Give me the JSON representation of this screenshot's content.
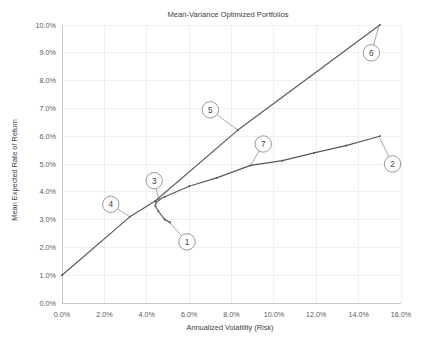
{
  "chart_data": {
    "type": "line",
    "title": "Mean-Variance Optimized Portfolios",
    "xlabel": "Annualized Volatility (Risk)",
    "ylabel": "Mean Expected Rate of Return",
    "xlim": [
      0.0,
      16.0
    ],
    "ylim": [
      0.0,
      10.0
    ],
    "xticks": [
      "0.0%",
      "2.0%",
      "4.0%",
      "6.0%",
      "8.0%",
      "10.0%",
      "12.0%",
      "14.0%",
      "16.0%"
    ],
    "yticks": [
      "0.0%",
      "1.0%",
      "2.0%",
      "3.0%",
      "4.0%",
      "5.0%",
      "6.0%",
      "7.0%",
      "8.0%",
      "9.0%",
      "10.0%"
    ],
    "xtick_values": [
      0,
      2,
      4,
      6,
      8,
      10,
      12,
      14,
      16
    ],
    "ytick_values": [
      0,
      1,
      2,
      3,
      4,
      5,
      6,
      7,
      8,
      9,
      10
    ],
    "grid": true,
    "legend": "none",
    "series": [
      {
        "name": "Capital Allocation Line",
        "x": [
          0.0,
          3.2,
          4.4,
          8.3,
          15.0
        ],
        "y": [
          1.0,
          3.1,
          3.67,
          6.22,
          10.0
        ]
      },
      {
        "name": "Efficient Frontier",
        "x": [
          5.1,
          4.85,
          4.55,
          4.4,
          4.45,
          4.6,
          4.85,
          6.0,
          7.3,
          8.9,
          10.4,
          11.9,
          13.4,
          15.0
        ],
        "y": [
          2.9,
          3.0,
          3.3,
          3.5,
          3.62,
          3.72,
          3.82,
          4.2,
          4.5,
          4.95,
          5.12,
          5.4,
          5.66,
          6.0
        ]
      }
    ],
    "annotations": [
      {
        "label": "1",
        "circle_x": 5.9,
        "circle_y": 2.2,
        "target_x": 5.05,
        "target_y": 2.92
      },
      {
        "label": "2",
        "circle_x": 15.6,
        "circle_y": 5.0,
        "target_x": 15.0,
        "target_y": 5.92
      },
      {
        "label": "3",
        "circle_x": 4.35,
        "circle_y": 4.4,
        "target_x": 4.55,
        "target_y": 3.78
      },
      {
        "label": "4",
        "circle_x": 2.3,
        "circle_y": 3.55,
        "target_x": 3.2,
        "target_y": 3.1
      },
      {
        "label": "5",
        "circle_x": 7.0,
        "circle_y": 6.95,
        "target_x": 8.3,
        "target_y": 6.22
      },
      {
        "label": "6",
        "circle_x": 14.6,
        "circle_y": 9.0,
        "target_x": 14.95,
        "target_y": 9.95
      },
      {
        "label": "7",
        "circle_x": 9.5,
        "circle_y": 5.72,
        "target_x": 8.9,
        "target_y": 4.95
      }
    ]
  },
  "caption": ""
}
